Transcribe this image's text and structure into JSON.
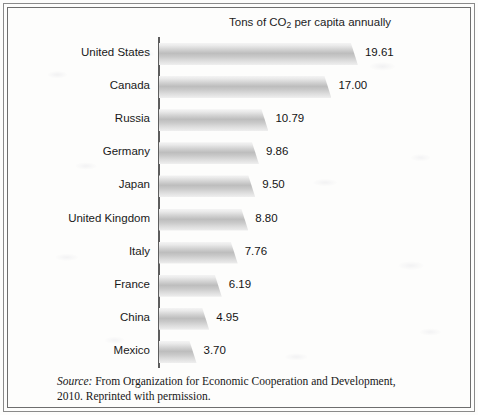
{
  "chart_data": {
    "type": "bar",
    "orientation": "horizontal",
    "title": "Tons of CO2 per capita annually",
    "title_prefix": "Tons of CO",
    "title_sub": "2",
    "title_suffix": " per capita annually",
    "xlabel": "",
    "ylabel": "",
    "grid": false,
    "legend": "none",
    "xlim": [
      0,
      21
    ],
    "categories": [
      "United States",
      "Canada",
      "Russia",
      "Germany",
      "Japan",
      "United Kingdom",
      "Italy",
      "France",
      "China",
      "Mexico"
    ],
    "values": [
      19.61,
      17.0,
      10.79,
      9.86,
      9.5,
      8.8,
      7.76,
      6.19,
      4.95,
      3.7
    ],
    "value_labels": [
      "19.61",
      "17.00",
      "10.79",
      "9.86",
      "9.50",
      "8.80",
      "7.76",
      "6.19",
      "4.95",
      "3.70"
    ],
    "bars": [
      {
        "category": "United States",
        "value": 19.61,
        "label": "19.61"
      },
      {
        "category": "Canada",
        "value": 17.0,
        "label": "17.00"
      },
      {
        "category": "Russia",
        "value": 10.79,
        "label": "10.79"
      },
      {
        "category": "Germany",
        "value": 9.86,
        "label": "9.86"
      },
      {
        "category": "Japan",
        "value": 9.5,
        "label": "9.50"
      },
      {
        "category": "United Kingdom",
        "value": 8.8,
        "label": "8.80"
      },
      {
        "category": "Italy",
        "value": 7.76,
        "label": "7.76"
      },
      {
        "category": "France",
        "value": 6.19,
        "label": "6.19"
      },
      {
        "category": "China",
        "value": 4.95,
        "label": "4.95"
      },
      {
        "category": "Mexico",
        "value": 3.7,
        "label": "3.70"
      }
    ],
    "bar_fill_light": "#f4f4f4",
    "bar_fill_mid": "#bdbdbd",
    "axis_color": "#5d5d5d"
  },
  "caption": {
    "source_word": "Source:",
    "text": " From Organization for Economic Cooperation and Development, 2010. Reprinted with permission."
  }
}
